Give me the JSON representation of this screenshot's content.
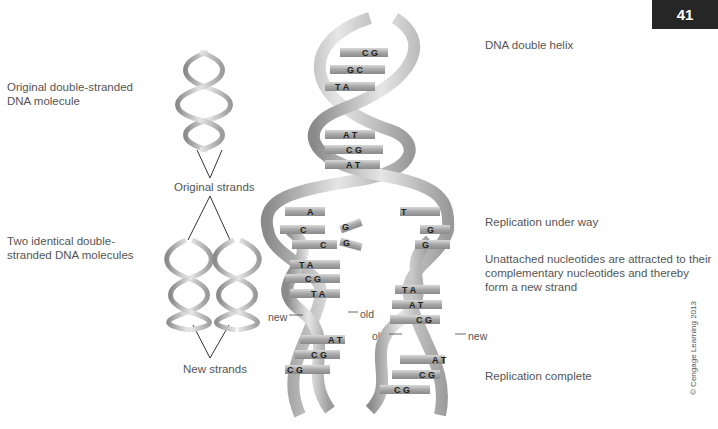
{
  "page_number": "41",
  "labels": {
    "original_molecule": [
      "Original double-stranded",
      "DNA molecule"
    ],
    "original_strands": "Original strands",
    "two_identical": [
      "Two identical double-",
      "stranded DNA molecules"
    ],
    "new_strands": "New strands",
    "dna_double_helix": "DNA double helix",
    "replication_under_way": "Replication under way",
    "unattached": [
      "Unattached nucleotides are attracted to their",
      "complementary nucleotides and thereby",
      "form a new strand"
    ],
    "replication_complete": "Replication complete",
    "new": "new",
    "old": "old"
  },
  "base_pairs": {
    "top_helix": [
      [
        "C",
        "G"
      ],
      [
        "G",
        "C"
      ],
      [
        "T",
        "A"
      ],
      [
        "A",
        "T"
      ],
      [
        "C",
        "G"
      ],
      [
        "A",
        "T"
      ]
    ],
    "left_unzipped": [
      "A",
      "C",
      "C"
    ],
    "right_unzipped": [
      "T",
      "G",
      "G"
    ],
    "free_nucleotides": [
      "G",
      "G"
    ],
    "left_daughter": [
      [
        "T",
        "A"
      ],
      [
        "C",
        "G"
      ],
      [
        "T",
        "A"
      ],
      [
        "A",
        "T"
      ],
      [
        "C",
        "G"
      ],
      [
        "C",
        "G"
      ]
    ],
    "right_daughter": [
      [
        "T",
        "A"
      ],
      [
        "A",
        "T"
      ],
      [
        "C",
        "G"
      ],
      [
        "A",
        "T"
      ],
      [
        "C",
        "G"
      ],
      [
        "C",
        "G"
      ]
    ]
  },
  "copyright": "© Cengage Learning 2013"
}
